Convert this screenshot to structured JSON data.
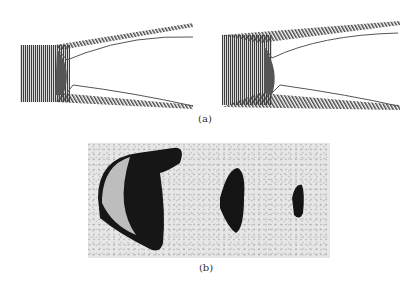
{
  "figure": {
    "panel_a": {
      "label": "(a)",
      "subfigures": [
        {
          "name": "simulation-left",
          "description": "particle simulation of shaped-charge jet / cavity collapse"
        },
        {
          "name": "simulation-right",
          "description": "particle simulation of shaped-charge jet / cavity collapse, later stage"
        }
      ]
    },
    "panel_b": {
      "label": "(b)",
      "subfigures": [
        {
          "name": "photo-1",
          "description": "experimental image, large dark shape"
        },
        {
          "name": "photo-2",
          "description": "experimental image, medium dark shape"
        },
        {
          "name": "photo-3",
          "description": "experimental image, small dark shape"
        }
      ]
    },
    "colors": {
      "particles": "#4a4a4a",
      "outline": "#555555",
      "photo_bg": "#e4e4e4",
      "dark_blob": "#111111"
    }
  }
}
